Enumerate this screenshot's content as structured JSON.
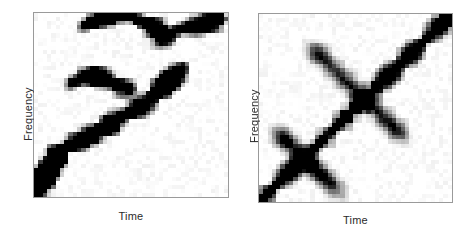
{
  "figure": {
    "background": "#ffffff",
    "panel_count": 2
  },
  "panels": [
    {
      "id": "panel-left",
      "xlabel": "Time",
      "ylabel": "Frequency"
    },
    {
      "id": "panel-right",
      "xlabel": "Time",
      "ylabel": "Frequency"
    }
  ],
  "chart_data": [
    {
      "type": "heatmap",
      "title": "",
      "xlabel": "Time",
      "ylabel": "Frequency",
      "grid": false,
      "legend": "none",
      "colormap": "grayscale-reversed",
      "colormap_min_color": "#ffffff",
      "colormap_max_color": "#000000",
      "nrows": 45,
      "ncols": 45,
      "xlim": [
        0,
        45
      ],
      "ylim": [
        0,
        45
      ],
      "description": "Fragmented time-frequency distribution: several broken ascending ridges plus a weak low-frequency ridge; many isolated dark cells and diffuse light speckle.",
      "ridges": [
        {
          "name": "upper-left-arc",
          "points": [
            [
              11,
              41
            ],
            [
              13,
              42
            ],
            [
              15,
              43
            ],
            [
              17,
              43
            ],
            [
              19,
              44
            ],
            [
              21,
              44
            ],
            [
              23,
              43
            ],
            [
              25,
              42
            ],
            [
              27,
              41
            ],
            [
              29,
              40
            ]
          ]
        },
        {
          "name": "upper-right-ascending",
          "points": [
            [
              29,
              38
            ],
            [
              31,
              39
            ],
            [
              33,
              40
            ],
            [
              35,
              41
            ],
            [
              37,
              41
            ],
            [
              39,
              42
            ],
            [
              41,
              42
            ],
            [
              43,
              43
            ]
          ]
        },
        {
          "name": "mid-cluster",
          "points": [
            [
              8,
              27
            ],
            [
              10,
              28
            ],
            [
              12,
              29
            ],
            [
              14,
              29
            ],
            [
              16,
              28
            ],
            [
              18,
              27
            ],
            [
              20,
              26
            ],
            [
              22,
              26
            ]
          ]
        },
        {
          "name": "lower-ascending",
          "points": [
            [
              1,
              2
            ],
            [
              2,
              4
            ],
            [
              3,
              7
            ],
            [
              4,
              9
            ],
            [
              6,
              11
            ],
            [
              8,
              12
            ],
            [
              10,
              13
            ],
            [
              12,
              14
            ],
            [
              14,
              15
            ],
            [
              16,
              16
            ],
            [
              18,
              18
            ],
            [
              20,
              19
            ],
            [
              22,
              20
            ],
            [
              24,
              21
            ],
            [
              26,
              23
            ],
            [
              28,
              25
            ],
            [
              30,
              27
            ],
            [
              32,
              29
            ],
            [
              34,
              31
            ]
          ]
        },
        {
          "name": "bottom-left-hot",
          "points": [
            [
              0,
              0
            ],
            [
              1,
              1
            ],
            [
              2,
              5
            ],
            [
              4,
              8
            ],
            [
              5,
              10
            ]
          ]
        }
      ],
      "peak_cells": [
        [
          17,
          44
        ],
        [
          20,
          44
        ],
        [
          24,
          42
        ],
        [
          30,
          40
        ],
        [
          36,
          41
        ],
        [
          41,
          42
        ],
        [
          43,
          43
        ],
        [
          12,
          29
        ],
        [
          16,
          28
        ],
        [
          3,
          7
        ],
        [
          1,
          2
        ],
        [
          0,
          0
        ],
        [
          14,
          15
        ],
        [
          22,
          20
        ],
        [
          28,
          25
        ]
      ]
    },
    {
      "type": "heatmap",
      "title": "",
      "xlabel": "Time",
      "ylabel": "Frequency",
      "grid": false,
      "legend": "none",
      "colormap": "grayscale-reversed",
      "colormap_min_color": "#ffffff",
      "colormap_max_color": "#000000",
      "nrows": 45,
      "ncols": 45,
      "xlim": [
        0,
        45
      ],
      "ylim": [
        0,
        45
      ],
      "description": "Strong continuous main diagonal ridge from lower-left to upper-right, with two faint X-shaped cross ridges (anti-diagonals) intersecting it near the lower-left quadrant and near the upper-middle.",
      "ridges": [
        {
          "name": "main-diagonal",
          "points": [
            [
              0,
              0
            ],
            [
              1,
              1
            ],
            [
              2,
              2
            ],
            [
              3,
              3
            ],
            [
              4,
              4
            ],
            [
              5,
              5
            ],
            [
              6,
              6
            ],
            [
              7,
              7
            ],
            [
              8,
              8
            ],
            [
              9,
              9
            ],
            [
              10,
              10
            ],
            [
              11,
              11
            ],
            [
              12,
              12
            ],
            [
              13,
              13
            ],
            [
              14,
              14
            ],
            [
              15,
              15
            ],
            [
              16,
              16
            ],
            [
              17,
              17
            ],
            [
              18,
              18
            ],
            [
              19,
              19
            ],
            [
              20,
              20
            ],
            [
              21,
              21
            ],
            [
              22,
              22
            ],
            [
              23,
              23
            ],
            [
              24,
              24
            ],
            [
              25,
              25
            ],
            [
              26,
              26
            ],
            [
              27,
              27
            ],
            [
              28,
              28
            ],
            [
              29,
              29
            ],
            [
              30,
              30
            ],
            [
              31,
              31
            ],
            [
              32,
              32
            ],
            [
              33,
              33
            ],
            [
              34,
              34
            ],
            [
              35,
              35
            ],
            [
              36,
              36
            ],
            [
              37,
              37
            ],
            [
              38,
              38
            ],
            [
              39,
              39
            ],
            [
              40,
              40
            ],
            [
              41,
              41
            ],
            [
              42,
              42
            ],
            [
              43,
              43
            ],
            [
              44,
              44
            ]
          ]
        },
        {
          "name": "cross-ridge-lower",
          "points": [
            [
              4,
              16
            ],
            [
              6,
              14
            ],
            [
              8,
              12
            ],
            [
              10,
              10
            ],
            [
              12,
              8
            ],
            [
              14,
              6
            ],
            [
              16,
              4
            ],
            [
              18,
              2
            ]
          ]
        },
        {
          "name": "cross-ridge-upper",
          "points": [
            [
              12,
              36
            ],
            [
              15,
              33
            ],
            [
              18,
              30
            ],
            [
              21,
              27
            ],
            [
              24,
              24
            ],
            [
              27,
              21
            ],
            [
              30,
              18
            ],
            [
              33,
              15
            ]
          ]
        }
      ],
      "peak_cells": [
        [
          0,
          0
        ],
        [
          2,
          2
        ],
        [
          6,
          6
        ],
        [
          10,
          10
        ],
        [
          14,
          14
        ],
        [
          19,
          19
        ],
        [
          23,
          23
        ],
        [
          27,
          27
        ],
        [
          31,
          31
        ],
        [
          35,
          35
        ],
        [
          39,
          39
        ],
        [
          42,
          42
        ],
        [
          44,
          44
        ]
      ]
    }
  ]
}
